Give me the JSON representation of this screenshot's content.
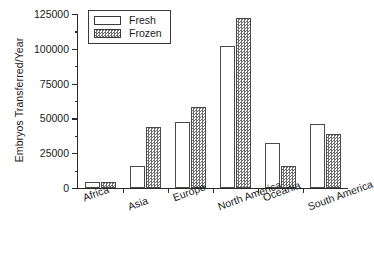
{
  "chart_data": {
    "type": "bar",
    "title": "",
    "xlabel": "",
    "ylabel": "Embryos Transferred/Year",
    "ylim": [
      0,
      125000
    ],
    "ytick_labels": [
      "0",
      "25000",
      "50000",
      "75000",
      "100000",
      "125000"
    ],
    "ytick_values": [
      0,
      25000,
      50000,
      75000,
      100000,
      125000
    ],
    "yminor_values": [
      12500,
      37500,
      62500,
      87500,
      112500
    ],
    "grid": false,
    "legend_position": "top-left",
    "categories": [
      "Africa",
      "Asia",
      "Europe",
      "North America",
      "Oceania",
      "South America"
    ],
    "series": [
      {
        "name": "Fresh",
        "values": [
          4000,
          16000,
          47500,
          102000,
          32500,
          46000
        ]
      },
      {
        "name": "Frozen",
        "values": [
          4000,
          44000,
          58500,
          122000,
          16000,
          39000
        ]
      }
    ]
  },
  "legend": {
    "items": [
      {
        "label": "Fresh",
        "swatch": "white-square-icon"
      },
      {
        "label": "Frozen",
        "swatch": "hatched-square-icon"
      }
    ]
  }
}
